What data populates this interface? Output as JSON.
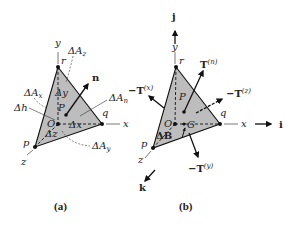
{
  "figure": {
    "panels": [
      {
        "caption": "(a)",
        "axes": {
          "y": "y",
          "x": "x",
          "z": "z"
        },
        "vertices": {
          "r": "r",
          "q": "q",
          "p": "p",
          "O": "O"
        },
        "point": "P",
        "normal": "n",
        "labels": {
          "dAz": "ΔA",
          "dAz_sub": "z",
          "dAx": "ΔA",
          "dAx_sub": "x",
          "dAn": "ΔA",
          "dAn_sub": "n",
          "dAy": "ΔA",
          "dAy_sub": "y",
          "dh": "Δh",
          "dy": "Δy",
          "dx": "Δx",
          "dz": "Δz"
        }
      },
      {
        "caption": "(b)",
        "axes": {
          "y": "y",
          "x": "x",
          "z": "z"
        },
        "unit_vectors": {
          "j": "j",
          "i": "i",
          "k": "k"
        },
        "vertices": {
          "r": "r",
          "q": "q",
          "p": "p",
          "O": "O"
        },
        "point": "P",
        "centroid": "G",
        "volume_label": "ΔB",
        "tractions": {
          "Tn": "T",
          "Tn_sup": "(n)",
          "Tx": "−T",
          "Tx_sup": "(x)",
          "Tz": "−T",
          "Tz_sup": "(z)",
          "Ty": "−T",
          "Ty_sup": "(y)"
        }
      }
    ],
    "colors": {
      "face": "#bdbdbd",
      "ink": "#111111",
      "label": "#222222"
    }
  }
}
